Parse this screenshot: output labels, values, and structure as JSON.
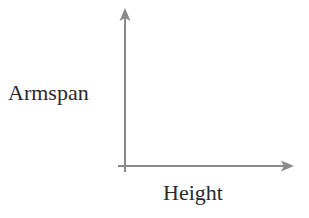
{
  "diagram": {
    "type": "axes",
    "y_axis": {
      "label": "Armspan"
    },
    "x_axis": {
      "label": "Height"
    },
    "colors": {
      "axis": "#8a8a8a",
      "text": "#2a2a2a",
      "background": "#ffffff"
    }
  }
}
